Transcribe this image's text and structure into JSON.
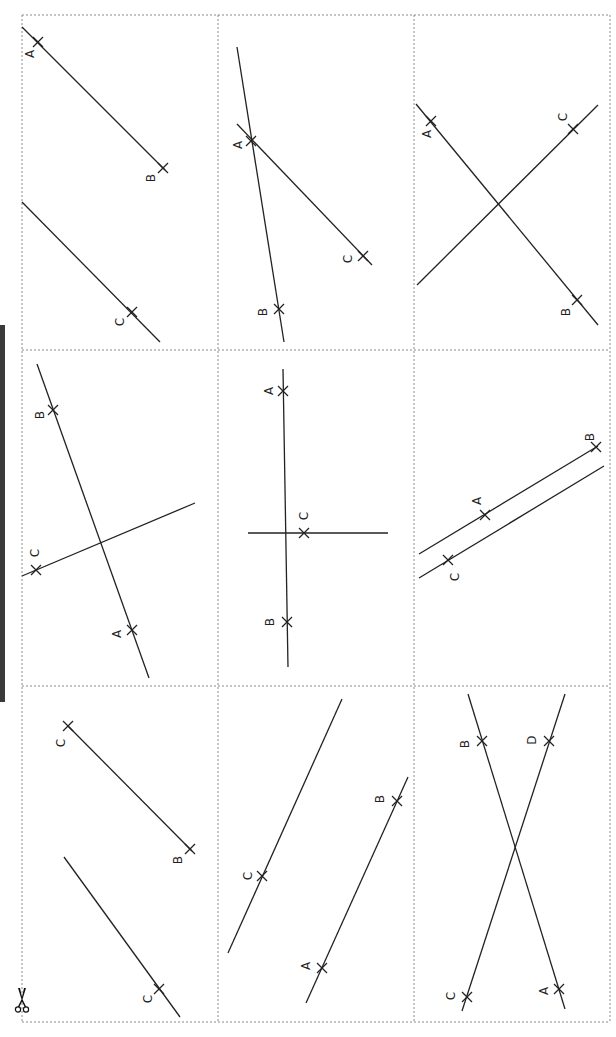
{
  "page": {
    "cut_marker": "scissors-icon",
    "colors": {
      "line": "#222222",
      "grid": "#8a8a8a",
      "bar": "#3a3a3a"
    }
  },
  "grid": {
    "x": [
      22,
      218,
      414,
      610
    ],
    "y": [
      15,
      350,
      686,
      1022
    ]
  },
  "panels": [
    {
      "id": "r0c0",
      "lines": [
        [
          22,
          27,
          165,
          170
        ],
        [
          22,
          202,
          160,
          342
        ]
      ],
      "points": [
        {
          "label": "A",
          "x": 38,
          "y": 42,
          "lx": 30,
          "ly": 54
        },
        {
          "label": "B",
          "x": 163,
          "y": 168,
          "lx": 151,
          "ly": 178
        },
        {
          "label": "C",
          "x": 132,
          "y": 312,
          "lx": 120,
          "ly": 322
        }
      ]
    },
    {
      "id": "r0c1",
      "lines": [
        [
          237,
          47,
          284,
          342
        ],
        [
          237,
          124,
          372,
          265
        ]
      ],
      "points": [
        {
          "label": "A",
          "x": 251,
          "y": 141,
          "lx": 238,
          "ly": 145
        },
        {
          "label": "B",
          "x": 279,
          "y": 309,
          "lx": 263,
          "ly": 312
        },
        {
          "label": "C",
          "x": 363,
          "y": 256,
          "lx": 348,
          "ly": 259
        }
      ]
    },
    {
      "id": "r0c2",
      "lines": [
        [
          416,
          104,
          598,
          325
        ],
        [
          417,
          285,
          598,
          105
        ]
      ],
      "points": [
        {
          "label": "A",
          "x": 431,
          "y": 121,
          "lx": 427,
          "ly": 134
        },
        {
          "label": "C",
          "x": 573,
          "y": 129,
          "lx": 563,
          "ly": 117
        },
        {
          "label": "B",
          "x": 577,
          "y": 300,
          "lx": 566,
          "ly": 312
        }
      ]
    },
    {
      "id": "r1c0",
      "lines": [
        [
          37,
          364,
          149,
          678
        ],
        [
          22,
          576,
          195,
          503
        ]
      ],
      "points": [
        {
          "label": "B",
          "x": 53,
          "y": 410,
          "lx": 40,
          "ly": 415
        },
        {
          "label": "C",
          "x": 36,
          "y": 570,
          "lx": 35,
          "ly": 553
        },
        {
          "label": "A",
          "x": 132,
          "y": 630,
          "lx": 117,
          "ly": 634
        }
      ]
    },
    {
      "id": "r1c1",
      "lines": [
        [
          283,
          369,
          288,
          667
        ],
        [
          248,
          533,
          388,
          533
        ]
      ],
      "points": [
        {
          "label": "A",
          "x": 283,
          "y": 391,
          "lx": 269,
          "ly": 391
        },
        {
          "label": "C",
          "x": 304,
          "y": 533,
          "lx": 304,
          "ly": 516
        },
        {
          "label": "B",
          "x": 287,
          "y": 622,
          "lx": 270,
          "ly": 622
        }
      ]
    },
    {
      "id": "r1c2",
      "lines": [
        [
          419,
          554,
          598,
          446
        ],
        [
          419,
          578,
          604,
          466
        ]
      ],
      "points": [
        {
          "label": "B",
          "x": 596,
          "y": 447,
          "lx": 590,
          "ly": 437
        },
        {
          "label": "A",
          "x": 485,
          "y": 515,
          "lx": 477,
          "ly": 501
        },
        {
          "label": "C",
          "x": 448,
          "y": 560,
          "lx": 455,
          "ly": 577
        }
      ]
    },
    {
      "id": "r2c0",
      "lines": [
        [
          68,
          726,
          192,
          851
        ],
        [
          64,
          857,
          180,
          1017
        ]
      ],
      "points": [
        {
          "label": "C",
          "x": 68,
          "y": 726,
          "lx": 61,
          "ly": 743
        },
        {
          "label": "B",
          "x": 190,
          "y": 849,
          "lx": 178,
          "ly": 860
        },
        {
          "label": "C",
          "x": 159,
          "y": 989,
          "lx": 148,
          "ly": 999
        }
      ]
    },
    {
      "id": "r2c1",
      "lines": [
        [
          228,
          953,
          342,
          699
        ],
        [
          306,
          1003,
          408,
          777
        ]
      ],
      "points": [
        {
          "label": "C",
          "x": 262,
          "y": 876,
          "lx": 248,
          "ly": 876
        },
        {
          "label": "B",
          "x": 397,
          "y": 801,
          "lx": 380,
          "ly": 799
        },
        {
          "label": "A",
          "x": 322,
          "y": 968,
          "lx": 306,
          "ly": 966
        }
      ]
    },
    {
      "id": "r2c2",
      "lines": [
        [
          468,
          694,
          565,
          1009
        ],
        [
          565,
          694,
          462,
          1011
        ]
      ],
      "points": [
        {
          "label": "B",
          "x": 482,
          "y": 741,
          "lx": 465,
          "ly": 744
        },
        {
          "label": "D",
          "x": 549,
          "y": 741,
          "lx": 532,
          "ly": 740
        },
        {
          "label": "A",
          "x": 559,
          "y": 989,
          "lx": 544,
          "ly": 991
        },
        {
          "label": "C",
          "x": 467,
          "y": 997,
          "lx": 451,
          "ly": 996
        }
      ]
    }
  ]
}
